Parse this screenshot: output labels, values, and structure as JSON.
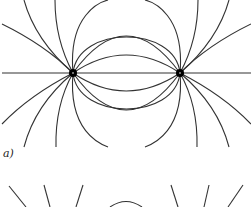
{
  "figure": {
    "type": "electric field lines diagram",
    "panel_label": "a)",
    "line_color": "#333333",
    "charge_color": "#000000",
    "charges": [
      {
        "name": "left-charge",
        "x": 73,
        "y": 73
      },
      {
        "name": "right-charge",
        "x": 180,
        "y": 73
      }
    ],
    "axis_line_y": 73,
    "inner_arc_peaks_above": [
      55,
      36,
      19,
      0
    ],
    "inner_arc_peaks_below": [
      91,
      110,
      128,
      146
    ],
    "second_panel_visible": "partial, bottom edge"
  }
}
